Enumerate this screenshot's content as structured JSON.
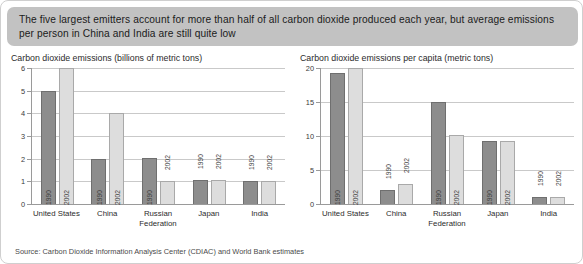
{
  "banner": {
    "text": "The five largest emitters account for more than half of all carbon dioxide produced each year, but average emissions per person in China and India are still quite low"
  },
  "source": {
    "text": "Source: Carbon Dioxide Information Analysis Center (CDIAC) and World Bank estimates"
  },
  "chart_data": [
    {
      "type": "bar",
      "title": "Carbon dioxide emissions (billions of metric tons)",
      "xlabel": "",
      "ylabel": "",
      "ylim": [
        0,
        6
      ],
      "yticks": [
        0,
        1,
        2,
        3,
        4,
        5,
        6
      ],
      "ytick_labels": [
        "0",
        "1",
        "2",
        "3",
        "4",
        "5",
        "6"
      ],
      "grid": true,
      "legend": "none",
      "categories": [
        "United States",
        "China",
        "Russian Federation",
        "Japan",
        "India"
      ],
      "series": [
        {
          "name": "1990",
          "values": [
            5.0,
            2.0,
            2.05,
            1.05,
            1.0
          ]
        },
        {
          "name": "2002",
          "values": [
            6.0,
            4.0,
            1.0,
            1.05,
            1.0
          ]
        }
      ]
    },
    {
      "type": "bar",
      "title": "Carbon dioxide emissions per capita (metric tons)",
      "xlabel": "",
      "ylabel": "",
      "ylim": [
        0,
        20
      ],
      "yticks": [
        0,
        5,
        10,
        15,
        20
      ],
      "ytick_labels": [
        "0",
        "5",
        "10",
        "15",
        "20"
      ],
      "grid": true,
      "legend": "none",
      "categories": [
        "United States",
        "China",
        "Russian Federation",
        "Japan",
        "India"
      ],
      "series": [
        {
          "name": "1990",
          "values": [
            19.2,
            2.0,
            15.0,
            9.2,
            1.0
          ]
        },
        {
          "name": "2002",
          "values": [
            20.0,
            3.0,
            10.2,
            9.25,
            1.0
          ]
        }
      ]
    }
  ]
}
